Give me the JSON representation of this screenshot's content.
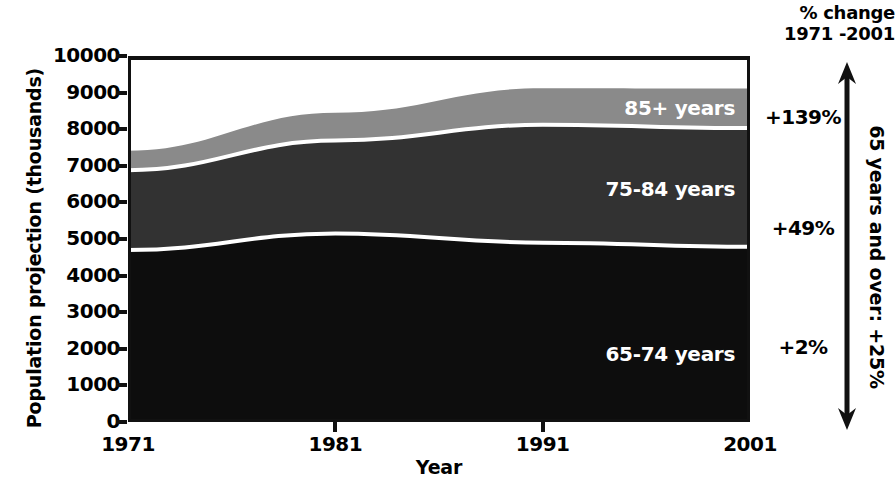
{
  "chart_data": {
    "type": "area",
    "title": "",
    "xlabel": "Year",
    "ylabel": "Population projection (thousands)",
    "x": [
      1971,
      1981,
      1991,
      2001
    ],
    "xticklabels": [
      "1971",
      "1981",
      "1991",
      "2001"
    ],
    "yticks": [
      0,
      1000,
      2000,
      3000,
      4000,
      5000,
      6000,
      7000,
      8000,
      9000,
      10000
    ],
    "yticklabels": [
      "0",
      "1000",
      "2000",
      "3000",
      "4000",
      "5000",
      "6000",
      "7000",
      "8000",
      "9000",
      "10000"
    ],
    "ylim": [
      0,
      10000
    ],
    "xlim": [
      1971,
      2001
    ],
    "grid": false,
    "legend_position": "inside-right-of-each-band",
    "stacked": true,
    "series": [
      {
        "name": "65-74 years",
        "label": "65-74 years",
        "color": "#0d0d0d",
        "values": [
          4700,
          5150,
          4900,
          4790
        ]
      },
      {
        "name": "75-84 years",
        "label": "75-84 years",
        "color": "#323232",
        "values": [
          2180,
          2540,
          3220,
          3240
        ]
      },
      {
        "name": "85+ years",
        "label": "85+ years",
        "color": "#8a8a8a",
        "values": [
          530,
          760,
          1000,
          1080
        ]
      }
    ],
    "cumulative_tops": {
      "65-74 years": [
        4700,
        5150,
        4900,
        4790
      ],
      "75-84 years": [
        6880,
        7690,
        8120,
        8030
      ],
      "85+ years": [
        7410,
        8450,
        9120,
        9110
      ]
    },
    "annotations": {
      "pct_change_header_line1": "% change",
      "pct_change_header_line2": "1971 -2001",
      "pct_changes": [
        {
          "series": "85+ years",
          "value": "+139%"
        },
        {
          "series": "75-84 years",
          "value": "+49%"
        },
        {
          "series": "65-74 years",
          "value": "+2%"
        }
      ],
      "total_bracket_label": "65 years and over: +25%"
    }
  },
  "axes": {
    "y_title": "Population projection (thousands)",
    "x_title": "Year"
  },
  "icons": {
    "double_arrow": "double-headed-vertical-arrow"
  }
}
